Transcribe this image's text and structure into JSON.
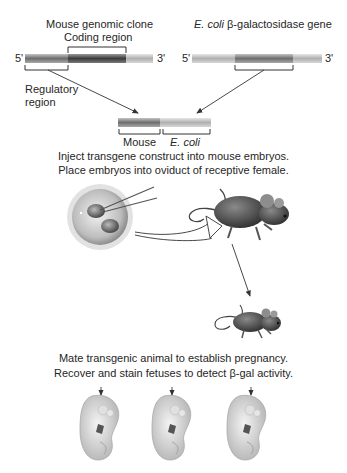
{
  "left_gene": {
    "title": "Mouse genomic clone",
    "coding_label": "Coding region",
    "regulatory_label_line1": "Regulatory",
    "regulatory_label_line2": "region",
    "five_prime": "5'",
    "three_prime": "3'"
  },
  "right_gene": {
    "title_italic": "E. coli",
    "title_beta": " β-galactosidase gene",
    "five_prime": "5'",
    "three_prime": "3'"
  },
  "construct": {
    "mouse_label": "Mouse",
    "ecoli_label": "E. coli"
  },
  "step1": {
    "line1": "Inject transgene construct into mouse embryos.",
    "line2": "Place embryos into oviduct of receptive female."
  },
  "step2": {
    "line1": "Mate transgenic animal to establish pregnancy.",
    "line2": "Recover and stain fetuses to detect β-gal activity."
  },
  "icons": {
    "embryo_injection": "microinjection-embryo-icon",
    "female_mouse": "mouse-icon",
    "transgenic_mouse": "mouse-icon",
    "fetuses": [
      "fetus-icon",
      "fetus-icon",
      "fetus-icon"
    ]
  },
  "colors": {
    "bar_dark": "#4a4a4a",
    "bar_mid": "#8a8a8a",
    "bar_light": "#c8c8c8",
    "arrow": "#333333"
  }
}
